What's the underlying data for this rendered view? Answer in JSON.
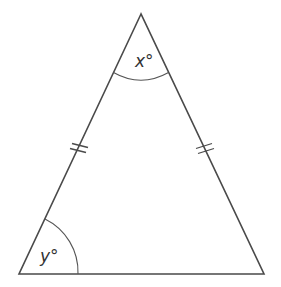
{
  "diagram": {
    "type": "isosceles-triangle",
    "stroke_color": "#4a4a4a",
    "vertices": {
      "apex": [
        141,
        14
      ],
      "bottom_left": [
        19,
        274
      ],
      "bottom_right": [
        264,
        274
      ]
    },
    "angles": {
      "apex": {
        "label": "x°"
      },
      "bottom_left": {
        "label": "y°"
      }
    },
    "equal_sides_marks": {
      "left_side": "double-tick",
      "right_side": "double-tick"
    }
  }
}
